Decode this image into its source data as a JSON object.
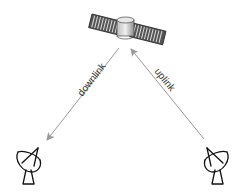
{
  "diagram": {
    "nodes": [
      {
        "id": "satellite",
        "icon": "satellite-icon"
      },
      {
        "id": "ground-station-left",
        "icon": "satellite-dish-icon"
      },
      {
        "id": "ground-station-right",
        "icon": "satellite-dish-icon"
      }
    ],
    "edges": [
      {
        "from": "satellite",
        "to": "ground-station-left",
        "label": "downlink"
      },
      {
        "from": "ground-station-right",
        "to": "satellite",
        "label": "uplink"
      }
    ],
    "labels": {
      "downlink": "downlink",
      "uplink": "uplink"
    },
    "colors": {
      "arrow": "#999999",
      "icon_stroke": "#111111",
      "text": "#333333"
    }
  }
}
